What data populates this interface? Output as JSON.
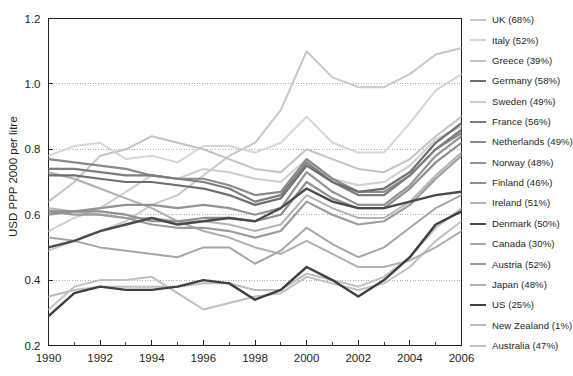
{
  "fragment_above": "",
  "chart_data": {
    "type": "line",
    "title": "",
    "xlabel": "",
    "ylabel": "USD PPP 2000 per litre",
    "xlim": [
      1990,
      2006
    ],
    "ylim": [
      0.2,
      1.2
    ],
    "yticks": [
      0.2,
      0.4,
      0.6,
      0.8,
      1.0,
      1.2
    ],
    "ytick_labels": [
      "0.2",
      "0.4",
      "0.6",
      "0.8",
      "1.0",
      "1.2"
    ],
    "xticks": [
      1990,
      1992,
      1994,
      1996,
      1998,
      2000,
      2002,
      2004,
      2006
    ],
    "xtick_labels": [
      "1990",
      "1992",
      "1994",
      "1996",
      "1998",
      "2000",
      "2002",
      "2004",
      "2006"
    ],
    "minor_xticks": [
      1991,
      1993,
      1995,
      1997,
      1999,
      2001,
      2003,
      2005
    ],
    "grid": "horizontal-dotted",
    "grid_color": "#9a9a9a",
    "legend_position": "right",
    "x": [
      1990,
      1991,
      1992,
      1993,
      1994,
      1995,
      1996,
      1997,
      1998,
      1999,
      2000,
      2001,
      2002,
      2003,
      2004,
      2005,
      2006
    ],
    "series": [
      {
        "name": "UK (68%)",
        "color": "#c9c9c9",
        "width": 2.0,
        "values": [
          0.49,
          0.52,
          0.55,
          0.58,
          0.63,
          0.66,
          0.72,
          0.78,
          0.82,
          0.92,
          1.1,
          1.02,
          0.99,
          0.99,
          1.03,
          1.09,
          1.11
        ]
      },
      {
        "name": "Italy (52%)",
        "color": "#d6d6d6",
        "width": 2.0,
        "values": [
          0.78,
          0.81,
          0.82,
          0.77,
          0.78,
          0.76,
          0.81,
          0.81,
          0.79,
          0.82,
          0.9,
          0.82,
          0.79,
          0.79,
          0.88,
          0.98,
          1.03
        ]
      },
      {
        "name": "Greece (39%)",
        "color": "#c4c4c4",
        "width": 2.0,
        "values": [
          0.64,
          0.7,
          0.78,
          0.8,
          0.84,
          0.82,
          0.8,
          0.77,
          0.74,
          0.73,
          0.8,
          0.77,
          0.74,
          0.73,
          0.77,
          0.84,
          0.9
        ]
      },
      {
        "name": "Germany (58%)",
        "color": "#6e6e6e",
        "width": 2.2,
        "values": [
          0.72,
          0.72,
          0.71,
          0.7,
          0.7,
          0.69,
          0.68,
          0.66,
          0.63,
          0.65,
          0.75,
          0.7,
          0.67,
          0.68,
          0.73,
          0.82,
          0.88
        ]
      },
      {
        "name": "Sweden (49%)",
        "color": "#cfcfcf",
        "width": 2.0,
        "values": [
          0.55,
          0.59,
          0.62,
          0.67,
          0.72,
          0.71,
          0.74,
          0.73,
          0.71,
          0.7,
          0.77,
          0.71,
          0.69,
          0.7,
          0.75,
          0.83,
          0.87
        ]
      },
      {
        "name": "France (56%)",
        "color": "#7d7d7d",
        "width": 2.2,
        "values": [
          0.74,
          0.74,
          0.73,
          0.72,
          0.72,
          0.71,
          0.7,
          0.68,
          0.64,
          0.66,
          0.76,
          0.7,
          0.66,
          0.66,
          0.72,
          0.8,
          0.86
        ]
      },
      {
        "name": "Netherlands (49%)",
        "color": "#8a8a8a",
        "width": 2.2,
        "values": [
          0.77,
          0.76,
          0.75,
          0.74,
          0.72,
          0.71,
          0.71,
          0.69,
          0.66,
          0.67,
          0.77,
          0.71,
          0.67,
          0.67,
          0.72,
          0.8,
          0.85
        ]
      },
      {
        "name": "Norway (48%)",
        "color": "#949494",
        "width": 2.2,
        "values": [
          0.6,
          0.61,
          0.62,
          0.63,
          0.63,
          0.62,
          0.63,
          0.62,
          0.6,
          0.62,
          0.73,
          0.67,
          0.63,
          0.63,
          0.69,
          0.78,
          0.84
        ]
      },
      {
        "name": "Finland (46%)",
        "color": "#8f8f8f",
        "width": 2.2,
        "values": [
          0.61,
          0.61,
          0.61,
          0.6,
          0.58,
          0.58,
          0.59,
          0.59,
          0.58,
          0.6,
          0.7,
          0.65,
          0.62,
          0.62,
          0.68,
          0.76,
          0.82
        ]
      },
      {
        "name": "Ireland (51%)",
        "color": "#b4b4b4",
        "width": 2.0,
        "values": [
          0.62,
          0.61,
          0.6,
          0.59,
          0.59,
          0.58,
          0.58,
          0.57,
          0.55,
          0.57,
          0.66,
          0.62,
          0.59,
          0.59,
          0.64,
          0.72,
          0.79
        ]
      },
      {
        "name": "Denmark (50%)",
        "color": "#4a4a4a",
        "width": 2.4,
        "values": [
          0.5,
          0.52,
          0.55,
          0.57,
          0.59,
          0.57,
          0.58,
          0.59,
          0.58,
          0.62,
          0.68,
          0.64,
          0.62,
          0.62,
          0.64,
          0.66,
          0.67
        ]
      },
      {
        "name": "Canada (30%)",
        "color": "#a6a6a6",
        "width": 2.0,
        "values": [
          0.53,
          0.52,
          0.5,
          0.49,
          0.48,
          0.47,
          0.5,
          0.5,
          0.45,
          0.49,
          0.56,
          0.51,
          0.47,
          0.5,
          0.56,
          0.62,
          0.66
        ]
      },
      {
        "name": "Austria (52%)",
        "color": "#9c9c9c",
        "width": 2.2,
        "values": [
          0.61,
          0.6,
          0.6,
          0.59,
          0.57,
          0.56,
          0.56,
          0.55,
          0.53,
          0.55,
          0.64,
          0.6,
          0.57,
          0.58,
          0.63,
          0.71,
          0.78
        ]
      },
      {
        "name": "Japan (48%)",
        "color": "#b0b0b0",
        "width": 2.0,
        "values": [
          0.73,
          0.71,
          0.68,
          0.65,
          0.62,
          0.58,
          0.55,
          0.53,
          0.5,
          0.48,
          0.52,
          0.48,
          0.44,
          0.44,
          0.46,
          0.5,
          0.55
        ]
      },
      {
        "name": "US (25%)",
        "color": "#3f3f3f",
        "width": 2.4,
        "values": [
          0.29,
          0.36,
          0.38,
          0.37,
          0.37,
          0.38,
          0.4,
          0.39,
          0.34,
          0.37,
          0.44,
          0.4,
          0.35,
          0.4,
          0.47,
          0.57,
          0.61
        ]
      },
      {
        "name": "New Zealand (1%)",
        "color": "#bdbdbd",
        "width": 2.0,
        "values": [
          0.35,
          0.37,
          0.38,
          0.38,
          0.38,
          0.38,
          0.39,
          0.39,
          0.37,
          0.37,
          0.42,
          0.4,
          0.38,
          0.41,
          0.47,
          0.56,
          0.62
        ]
      },
      {
        "name": "Australia (47%)",
        "color": "#c0c0c0",
        "width": 2.0,
        "values": [
          0.31,
          0.38,
          0.4,
          0.4,
          0.41,
          0.36,
          0.31,
          0.33,
          0.35,
          0.36,
          0.41,
          0.39,
          0.37,
          0.39,
          0.44,
          0.52,
          0.58
        ]
      }
    ]
  },
  "legend": {
    "items": [
      "UK (68%)",
      "Italy (52%)",
      "Greece (39%)",
      "Germany (58%)",
      "Sweden (49%)",
      "France (56%)",
      "Netherlands (49%)",
      "Norway (48%)",
      "Finland (46%)",
      "Ireland (51%)",
      "Denmark (50%)",
      "Canada (30%)",
      "Austria (52%)",
      "Japan (48%)",
      "US (25%)",
      "New Zealand (1%)",
      "Australia (47%)"
    ]
  }
}
